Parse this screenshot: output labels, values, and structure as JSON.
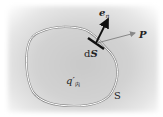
{
  "diagram": {
    "labels": {
      "normal_vector": "e",
      "normal_sub": "n",
      "field_point": "P",
      "surface_element": "dS",
      "surface_element_prefix": "d",
      "surface_element_var": "S",
      "enclosed_charge": "q′",
      "enclosed_sub": "内",
      "surface": "S"
    },
    "colors": {
      "background": "#cfcfcf",
      "surface_outline": "#ffffff",
      "surface_shadow": "#8a8a8a",
      "normal_arrow": "#111111",
      "p_arrow": "#888888",
      "text": "#222222"
    }
  }
}
